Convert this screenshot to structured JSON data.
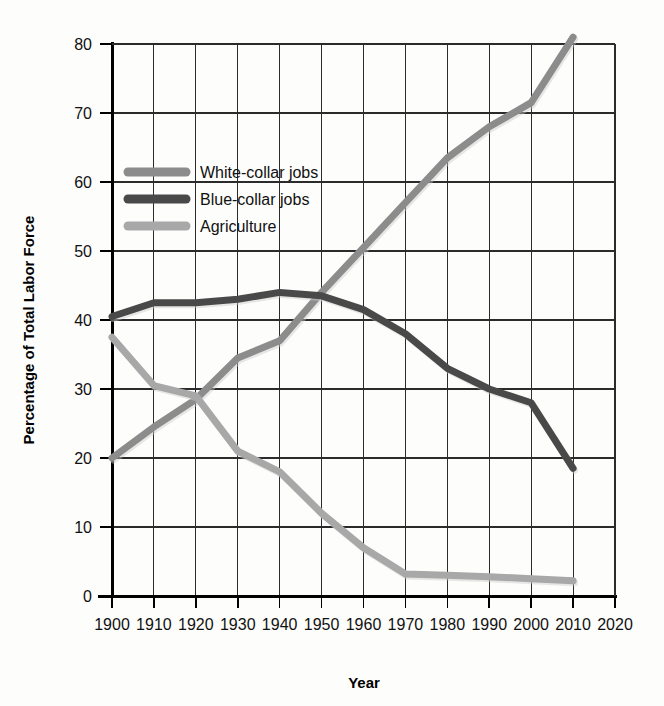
{
  "chart_data": {
    "type": "line",
    "title": "",
    "xlabel": "Year",
    "ylabel": "Percentage of Total Labor Force",
    "xlim": [
      1900,
      2020
    ],
    "ylim": [
      0,
      80
    ],
    "x_ticks": [
      1900,
      1910,
      1920,
      1930,
      1940,
      1950,
      1960,
      1970,
      1980,
      1990,
      2000,
      2010,
      2020
    ],
    "y_ticks": [
      0,
      10,
      20,
      30,
      40,
      50,
      60,
      70,
      80
    ],
    "grid": true,
    "legend_position": "upper-left-inside",
    "x": [
      1900,
      1910,
      1920,
      1930,
      1940,
      1950,
      1960,
      1970,
      1980,
      1990,
      2000,
      2010
    ],
    "series": [
      {
        "name": "White-collar jobs",
        "color": "#8c8c8c",
        "values": [
          20,
          24.5,
          28.5,
          34.5,
          37,
          44,
          50.5,
          57,
          63.5,
          68,
          71.5,
          81
        ]
      },
      {
        "name": "Blue-collar jobs",
        "color": "#494949",
        "values": [
          40.5,
          42.5,
          42.5,
          43,
          44,
          43.5,
          41.5,
          38,
          33,
          30,
          28,
          18.5
        ]
      },
      {
        "name": "Agriculture",
        "color": "#a8a8a8",
        "values": [
          37.5,
          30.5,
          29,
          21,
          18,
          12,
          7,
          3.2,
          3,
          2.8,
          2.5,
          2.2
        ]
      }
    ]
  },
  "legend": {
    "items": [
      {
        "label": "White-collar jobs",
        "color": "#8c8c8c"
      },
      {
        "label": "Blue-collar jobs",
        "color": "#494949"
      },
      {
        "label": "Agriculture",
        "color": "#a8a8a8"
      }
    ]
  },
  "axes": {
    "x_title": "Year",
    "y_title": "Percentage of Total Labor Force",
    "x_tick_labels": [
      "1900",
      "1910",
      "1920",
      "1930",
      "1940",
      "1950",
      "1960",
      "1970",
      "1980",
      "1990",
      "2000",
      "2010",
      "2020"
    ],
    "y_tick_labels": [
      "0",
      "10",
      "20",
      "30",
      "40",
      "50",
      "60",
      "70",
      "80"
    ]
  },
  "style": {
    "background": "#fdfdfc",
    "grid_color": "#2b2b2b",
    "axis_color": "#000000"
  }
}
